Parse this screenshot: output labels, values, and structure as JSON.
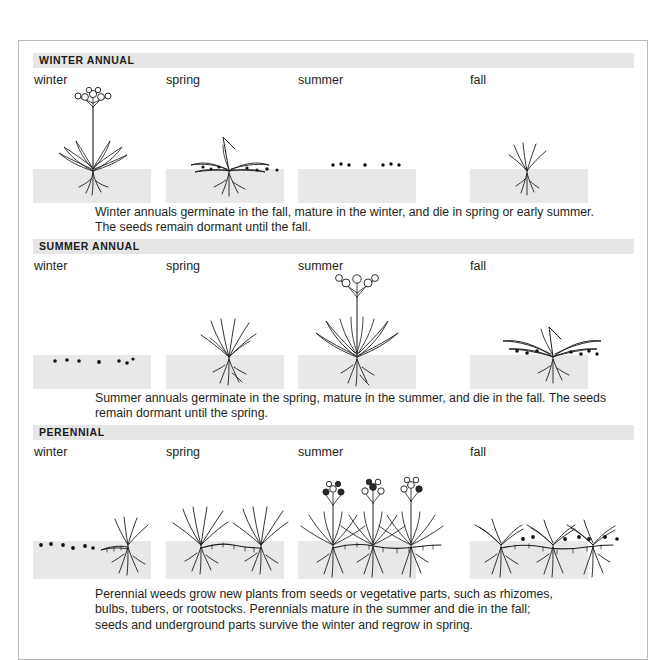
{
  "figure": {
    "seasons": [
      "winter",
      "spring",
      "summer",
      "fall"
    ],
    "colors": {
      "soil": "#e8e8e8",
      "section_bar": "#e6e6e6",
      "ink": "#1b1b1b",
      "frame_border": "#b9b9b9",
      "text": "#231f20"
    },
    "sections": [
      {
        "id": "winter-annual",
        "heading": "WINTER ANNUAL",
        "seasons": [
          "winter",
          "spring",
          "summer",
          "fall"
        ],
        "stages": [
          {
            "season": "winter",
            "state": "mature flowering plant"
          },
          {
            "season": "spring",
            "state": "dying plant shedding seeds"
          },
          {
            "season": "summer",
            "state": "dormant seeds in soil"
          },
          {
            "season": "fall",
            "state": "germinating seedling"
          }
        ],
        "caption_lines": [
          "Winter annuals germinate in the fall, mature in the winter, and die in spring or early summer.",
          "The seeds remain dormant until the fall."
        ]
      },
      {
        "id": "summer-annual",
        "heading": "SUMMER ANNUAL",
        "seasons": [
          "winter",
          "spring",
          "summer",
          "fall"
        ],
        "stages": [
          {
            "season": "winter",
            "state": "dormant seeds in soil"
          },
          {
            "season": "spring",
            "state": "young seedling"
          },
          {
            "season": "summer",
            "state": "mature flowering plant"
          },
          {
            "season": "fall",
            "state": "dying plant shedding seeds"
          }
        ],
        "caption_lines": [
          "Summer annuals germinate in the spring, mature in the summer, and die in the fall. The seeds",
          "remain dormant until the spring."
        ]
      },
      {
        "id": "perennial",
        "heading": "PERENNIAL",
        "seasons": [
          "winter",
          "spring",
          "summer",
          "fall"
        ],
        "stages": [
          {
            "season": "winter",
            "state": "dormant seeds and surviving rhizome"
          },
          {
            "season": "spring",
            "state": "new shoots from rhizomes"
          },
          {
            "season": "summer",
            "state": "mature flowering plants linked by rhizomes"
          },
          {
            "season": "fall",
            "state": "plants dying back, seeds shed, rhizomes persist"
          }
        ],
        "caption_lines": [
          "Perennial weeds grow new plants from seeds or vegetative parts, such as rhizomes,",
          "bulbs, tubers, or rootstocks. Perennials mature in the summer and die in the fall;",
          "seeds and underground parts survive the winter and regrow in spring."
        ]
      }
    ]
  }
}
